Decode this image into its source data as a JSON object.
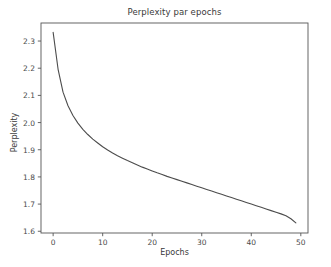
{
  "chart_data": {
    "type": "line",
    "title": "Perplexity par epochs",
    "xlabel": "Epochs",
    "ylabel": "Perplexity",
    "xlim": [
      -2.45,
      51.45
    ],
    "ylim": [
      1.5936,
      2.3664
    ],
    "xticks": [
      0,
      10,
      20,
      30,
      40,
      50
    ],
    "xtick_labels": [
      "0",
      "10",
      "20",
      "30",
      "40",
      "50"
    ],
    "yticks": [
      1.6,
      1.7,
      1.8,
      1.9,
      2.0,
      2.1,
      2.2,
      2.3
    ],
    "ytick_labels": [
      "1.6",
      "1.7",
      "1.8",
      "1.9",
      "2.0",
      "2.1",
      "2.2",
      "2.3"
    ],
    "grid": false,
    "legend": null,
    "line_color": "#4c4c4c",
    "line_width": 1.1,
    "series": [
      {
        "name": "Perplexity",
        "x": [
          0,
          1,
          2,
          3,
          4,
          5,
          6,
          7,
          8,
          9,
          10,
          11,
          12,
          13,
          14,
          15,
          16,
          17,
          18,
          19,
          20,
          21,
          22,
          23,
          24,
          25,
          26,
          27,
          28,
          29,
          30,
          31,
          32,
          33,
          34,
          35,
          36,
          37,
          38,
          39,
          40,
          41,
          42,
          43,
          44,
          45,
          46,
          47,
          48,
          49
        ],
        "values": [
          2.332,
          2.196,
          2.112,
          2.062,
          2.026,
          1.998,
          1.975,
          1.956,
          1.939,
          1.925,
          1.911,
          1.899,
          1.888,
          1.878,
          1.869,
          1.86,
          1.852,
          1.844,
          1.836,
          1.829,
          1.822,
          1.815,
          1.809,
          1.802,
          1.796,
          1.79,
          1.784,
          1.778,
          1.772,
          1.766,
          1.76,
          1.754,
          1.748,
          1.742,
          1.736,
          1.73,
          1.724,
          1.718,
          1.712,
          1.706,
          1.7,
          1.694,
          1.688,
          1.682,
          1.676,
          1.67,
          1.664,
          1.657,
          1.646,
          1.631
        ]
      }
    ]
  },
  "figure": {
    "background_color": "#ffffff",
    "axes_color": "#555555",
    "text_color": "#3a3a3a"
  }
}
